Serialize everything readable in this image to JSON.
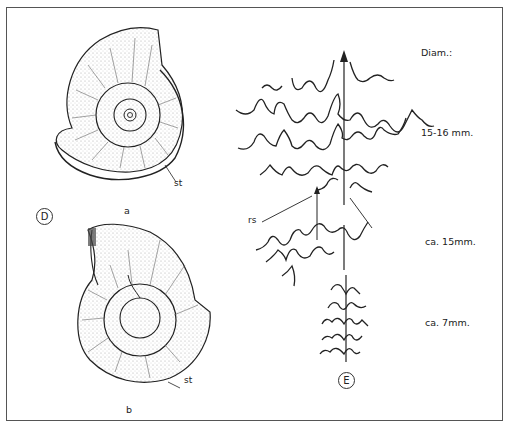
{
  "figure": {
    "panel_d": {
      "label": "D",
      "view_a_caption": "a",
      "view_b_caption": "b",
      "st_label_a": "st",
      "st_label_b": "st"
    },
    "panel_e": {
      "label": "E",
      "heading": "Diam.:",
      "rows": [
        {
          "diameter": "15-16 mm."
        },
        {
          "diameter": "ca. 15mm."
        },
        {
          "diameter": "ca. 7mm."
        }
      ],
      "rs_label": "rs"
    }
  },
  "colors": {
    "ink": "#222222",
    "frame": "#555555",
    "stipple": "#888888"
  }
}
